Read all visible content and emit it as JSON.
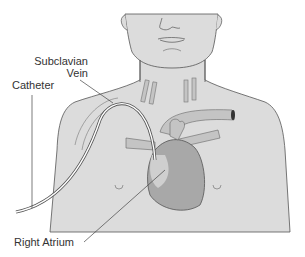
{
  "diagram": {
    "labels": {
      "subclavian_line1": "Subclavian",
      "subclavian_line2": "Vein",
      "catheter": "Catheter",
      "right_atrium": "Right Atrium"
    },
    "colors": {
      "skin": "#dcdcdc",
      "outline": "#555555",
      "vessel": "#c4c4c4",
      "heart_dark": "#a8a8a8",
      "heart_light": "#cfcfcf",
      "catheter": "#ffffff",
      "text": "#333333"
    }
  }
}
